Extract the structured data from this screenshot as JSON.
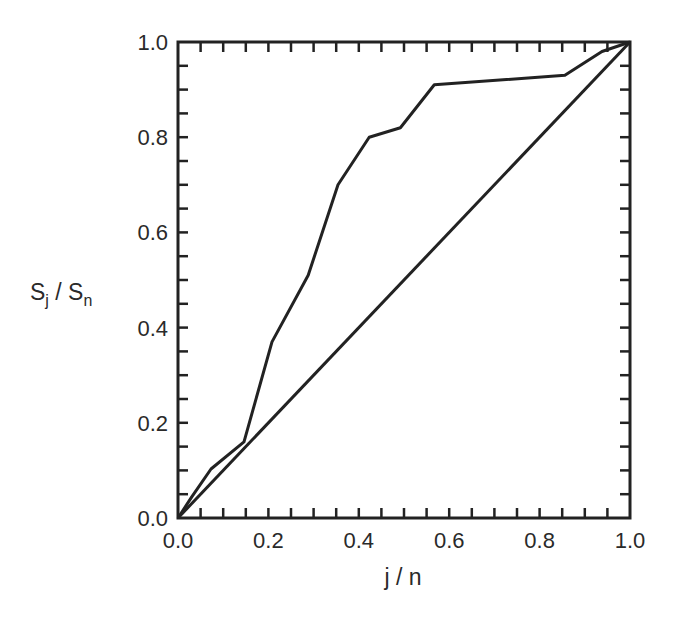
{
  "chart_data": {
    "type": "line",
    "title": "",
    "xlabel": "j / n",
    "ylabel": "S_j / S_n",
    "xlim": [
      0.0,
      1.0
    ],
    "ylim": [
      0.0,
      1.0
    ],
    "grid": false,
    "legend": null,
    "x_ticks": [
      "0.0",
      "0.2",
      "0.4",
      "0.6",
      "0.8",
      "1.0"
    ],
    "y_ticks": [
      "0.0",
      "0.2",
      "0.4",
      "0.6",
      "0.8",
      "1.0"
    ],
    "minor_tick_step": 0.05,
    "series": [
      {
        "name": "cumulative curve",
        "x": [
          0.0,
          0.03,
          0.073,
          0.146,
          0.208,
          0.288,
          0.354,
          0.423,
          0.492,
          0.567,
          0.856,
          0.938,
          1.0
        ],
        "y": [
          0.0,
          0.044,
          0.103,
          0.16,
          0.37,
          0.51,
          0.7,
          0.8,
          0.82,
          0.91,
          0.93,
          0.98,
          1.0
        ]
      },
      {
        "name": "diagonal reference",
        "x": [
          0.0,
          1.0
        ],
        "y": [
          0.0,
          1.0
        ]
      }
    ]
  },
  "labels": {
    "xlabel": "j / n",
    "ylabel_main_1": "S",
    "ylabel_sub_1": "j",
    "ylabel_sep": " / ",
    "ylabel_main_2": "S",
    "ylabel_sub_2": "n"
  },
  "style": {
    "line_color": "#222222",
    "axis_color": "#222222",
    "background": "#ffffff"
  }
}
